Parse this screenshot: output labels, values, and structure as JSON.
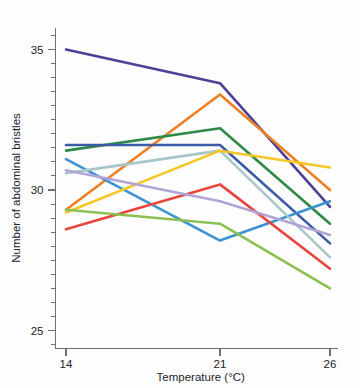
{
  "chart_data": {
    "type": "line",
    "title": "",
    "subtitle": "",
    "xlabel": "Temperature (°C)",
    "ylabel": "Number of abdominal bristles",
    "x": [
      14,
      21,
      26
    ],
    "categories": [
      "14",
      "21",
      "26"
    ],
    "xtick_labels": [
      "14",
      "21",
      "26"
    ],
    "ytick_labels": [
      "25",
      "30",
      "35"
    ],
    "ytick_values": [
      25,
      30,
      35
    ],
    "yminor_values": [
      24.5,
      25.5,
      26,
      26.5,
      27,
      27.5,
      28,
      28.5,
      29,
      29.5,
      30.5,
      31,
      31.5,
      32,
      32.5,
      33,
      33.5,
      34,
      34.5,
      35.5
    ],
    "xlim": [
      13.0,
      27.2
    ],
    "ylim": [
      23.9,
      35.9
    ],
    "grid": false,
    "legend": false,
    "legend_position": "none",
    "axis_color": "#6f6f78",
    "background_color": "#fdfdfd",
    "series": [
      {
        "name": "line-1-dark-purple",
        "color": "#4f3f97",
        "values": [
          35.0,
          33.8,
          29.4
        ]
      },
      {
        "name": "line-2-orange",
        "color": "#ef8022",
        "values": [
          29.3,
          33.4,
          30.0
        ]
      },
      {
        "name": "line-3-green",
        "color": "#2f8a47",
        "values": [
          31.4,
          32.2,
          28.8
        ]
      },
      {
        "name": "line-4-dark-blue",
        "color": "#3b5ba5",
        "values": [
          31.6,
          31.6,
          28.1
        ]
      },
      {
        "name": "line-5-blue",
        "color": "#3d92d2",
        "values": [
          31.1,
          28.2,
          29.6
        ]
      },
      {
        "name": "line-6-pale-teal",
        "color": "#a9c6c8",
        "values": [
          30.6,
          31.4,
          27.6
        ]
      },
      {
        "name": "line-7-yellow",
        "color": "#f4c727",
        "values": [
          29.2,
          31.4,
          30.8
        ]
      },
      {
        "name": "line-8-red",
        "color": "#e8453c",
        "values": [
          28.6,
          30.2,
          27.2
        ]
      },
      {
        "name": "line-9-light-purple",
        "color": "#b1a5d6",
        "values": [
          30.7,
          29.6,
          28.4
        ]
      },
      {
        "name": "line-10-light-green",
        "color": "#8cc152",
        "values": [
          29.3,
          28.8,
          26.5
        ]
      }
    ]
  }
}
